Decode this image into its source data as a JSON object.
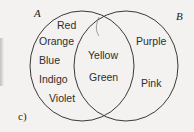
{
  "figure": {
    "part_label": "c)",
    "type": "venn-diagram",
    "background_color": "#f3f2f0",
    "outline_color": "#3a3a3a",
    "text_color": "#2e2e2e"
  },
  "sets": {
    "left": {
      "name": "A",
      "exclusive_items": [
        "Red",
        "Orange",
        "Blue",
        "Indigo",
        "Violet"
      ]
    },
    "right": {
      "name": "B",
      "exclusive_items": [
        "Purple",
        "Pink"
      ]
    },
    "intersection": {
      "items": [
        "Yellow",
        "Green"
      ]
    }
  },
  "annotations": {
    "pen_mark": "small-curve-near-top-intersection"
  }
}
